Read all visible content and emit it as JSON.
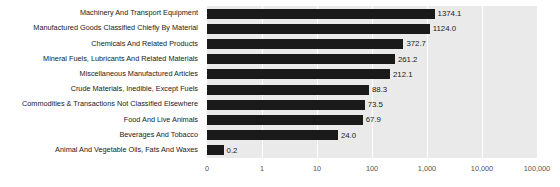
{
  "chart_data": {
    "type": "bar",
    "orientation": "horizontal",
    "title": "",
    "xlabel": "",
    "ylabel": "",
    "xscale": "log",
    "grid": true,
    "legend": "none",
    "xticks": [
      "0",
      "1",
      "10",
      "100",
      "1,000",
      "10,000",
      "100,000"
    ],
    "xtick_values": [
      0,
      1,
      10,
      100,
      1000,
      10000,
      100000
    ],
    "categories": [
      "Machinery And Transport Equipment",
      "Manufactured Goods Classified Chiefly By Material",
      "Chemicals And Related Products",
      "Mineral Fuels, Lubricants And Related Materials",
      "Miscellaneous Manufactured Articles",
      "Crude Materials, Inedible, Except Fuels",
      "Commodities & Transactions Not Classified Elsewhere",
      "Food And Live Animals",
      "Beverages And Tobacco",
      "Animal And Vegetable Oils, Fats And Waxes"
    ],
    "values": [
      1374.1,
      1124.0,
      372.7,
      261.2,
      212.1,
      88.3,
      73.5,
      67.9,
      24.0,
      0.2
    ],
    "value_labels": [
      "1374.1",
      "1124.0",
      "372.7",
      "261.2",
      "212.1",
      "88.3",
      "73.5",
      "67.9",
      "24.0",
      "0.2"
    ],
    "bar_color": "#1a1a1a",
    "plot_background": "#eaeaea",
    "gridline_color": "#ffffff",
    "page_background": "#ffffff"
  }
}
